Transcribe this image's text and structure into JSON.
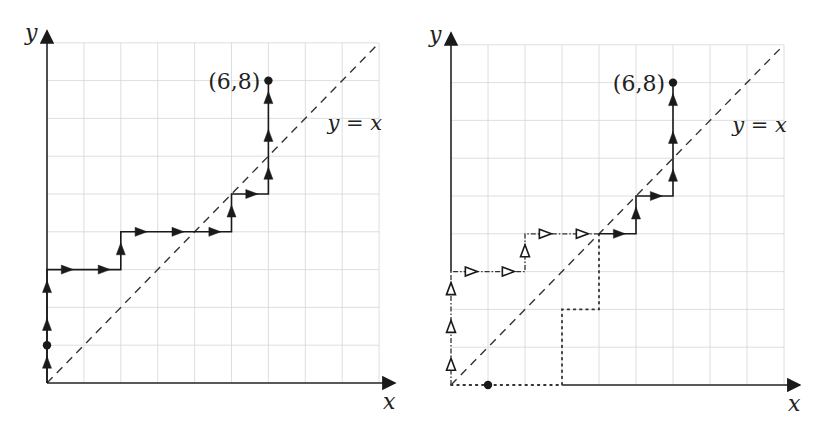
{
  "figure": {
    "colors": {
      "ink": "#1a1a1a",
      "grid": "#d6d6d6",
      "background": "#ffffff"
    }
  },
  "panels": [
    {
      "id": "left",
      "origin_px": [
        47,
        383
      ],
      "cell_px": [
        36.9,
        37.8
      ],
      "grid_extent": [
        9,
        9
      ],
      "axis_labels": {
        "x": "x",
        "y": "y"
      },
      "diagonal_label": "y = x",
      "endpoint_label": "(6,8)",
      "endpoint": [
        6,
        8
      ],
      "marked_points": [
        [
          0,
          1
        ],
        [
          6,
          8
        ]
      ],
      "paths": [
        {
          "style": "solid",
          "arrow": "filled",
          "points": [
            [
              0,
              0
            ],
            [
              0,
              3
            ],
            [
              2,
              3
            ],
            [
              2,
              4
            ],
            [
              5,
              4
            ],
            [
              5,
              5
            ],
            [
              6,
              5
            ],
            [
              6,
              8
            ]
          ]
        }
      ]
    },
    {
      "id": "right",
      "origin_px": [
        451,
        385
      ],
      "cell_px": [
        37.0,
        37.8
      ],
      "grid_extent": [
        9,
        9
      ],
      "axis_labels": {
        "x": "x",
        "y": "y"
      },
      "diagonal_label": "y = x",
      "endpoint_label": "(6,8)",
      "endpoint": [
        6,
        8
      ],
      "marked_points": [
        [
          1,
          0
        ],
        [
          6,
          8
        ]
      ],
      "paths": [
        {
          "style": "dashdot",
          "arrow": "hollow",
          "points": [
            [
              0,
              0
            ],
            [
              0,
              3
            ],
            [
              2,
              3
            ],
            [
              2,
              4
            ],
            [
              4,
              4
            ]
          ]
        },
        {
          "style": "dotted",
          "arrow": "none",
          "points": [
            [
              0,
              0
            ],
            [
              3,
              0
            ],
            [
              3,
              2
            ],
            [
              4,
              2
            ],
            [
              4,
              4
            ]
          ]
        },
        {
          "style": "solid",
          "arrow": "filled",
          "points": [
            [
              4,
              4
            ],
            [
              5,
              4
            ],
            [
              5,
              5
            ],
            [
              6,
              5
            ],
            [
              6,
              8
            ]
          ]
        }
      ]
    }
  ]
}
